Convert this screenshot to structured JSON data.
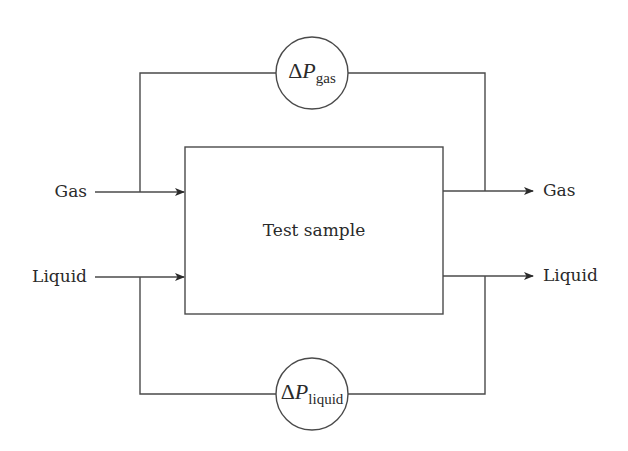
{
  "diagram": {
    "center_box": {
      "label": "Test sample"
    },
    "inputs": [
      {
        "label": "Gas"
      },
      {
        "label": "Liquid"
      }
    ],
    "outputs": [
      {
        "label": "Gas"
      },
      {
        "label": "Liquid"
      }
    ],
    "gauges": {
      "gas": {
        "symbol": "Δ",
        "var": "P",
        "subscript": "gas"
      },
      "liquid": {
        "symbol": "Δ",
        "var": "P",
        "subscript": "liquid"
      }
    },
    "colors": {
      "line": "#4a4a4a",
      "text": "#2a2a2a"
    }
  }
}
